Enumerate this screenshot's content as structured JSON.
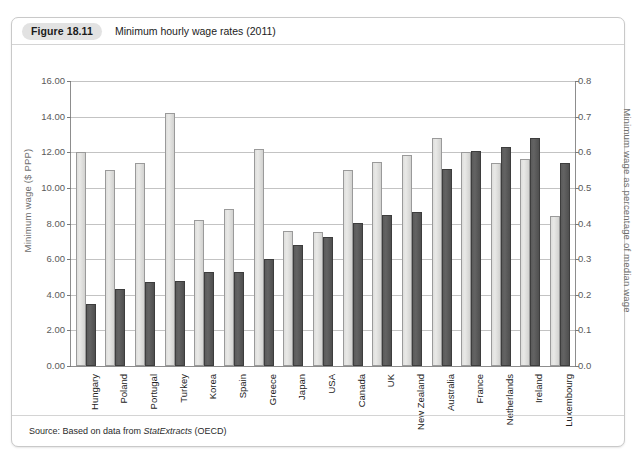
{
  "figure": {
    "number": "Figure 18.11",
    "caption": "Minimum hourly wage rates (2011)",
    "source_prefix": "Source: Based on data from ",
    "source_italic": "StatExtracts",
    "source_suffix": " (OECD)"
  },
  "colors": {
    "light_bar": "#dededc",
    "dark_bar": "#5b5b5b",
    "gridline": "#c3c3c3",
    "axis": "#8d8d8d",
    "axis_title": "#6e6e6e",
    "badge": "#e2e2e2",
    "card_border": "#c9c9c9"
  },
  "chart_data": {
    "type": "bar",
    "title": "Minimum hourly wage rates (2011)",
    "xlabel": "",
    "ylabel": "Minimum wage ($ PPP)",
    "y2label": "Minimum wage as percentage of median wage",
    "ylim": [
      0,
      16
    ],
    "y2lim": [
      0,
      0.8
    ],
    "yticks": [
      "0.00",
      "2.00",
      "4.00",
      "6.00",
      "8.00",
      "10.00",
      "12.00",
      "14.00",
      "16.00"
    ],
    "y2ticks": [
      "0.0",
      "0.1",
      "0.2",
      "0.3",
      "0.4",
      "0.5",
      "0.6",
      "0.7",
      "0.8"
    ],
    "grid": true,
    "legend": "none",
    "categories": [
      "Hungary",
      "Poland",
      "Portugal",
      "Turkey",
      "Korea",
      "Spain",
      "Greece",
      "Japan",
      "USA",
      "Canada",
      "UK",
      "New Zealand",
      "Australia",
      "France",
      "Netherlands",
      "Ireland",
      "Luxembourg"
    ],
    "series": [
      {
        "name": "Minimum wage ($ PPP)",
        "axis": "left",
        "color": "#dededc",
        "values": [
          12.0,
          11.0,
          11.4,
          14.2,
          8.2,
          8.8,
          12.2,
          7.6,
          7.5,
          11.0,
          11.45,
          11.85,
          12.8,
          12.0,
          11.4,
          11.6,
          8.4
        ]
      },
      {
        "name": "Minimum wage as percentage of median wage",
        "axis": "right",
        "color": "#5b5b5b",
        "values": [
          3.5,
          4.3,
          4.7,
          4.75,
          5.3,
          5.3,
          6.0,
          6.8,
          7.25,
          8.05,
          8.5,
          8.65,
          11.05,
          12.05,
          12.3,
          12.8,
          11.4
        ]
      }
    ]
  }
}
